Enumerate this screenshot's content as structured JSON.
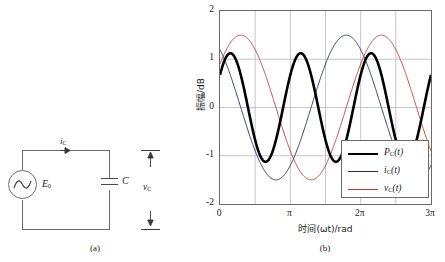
{
  "figure": {
    "panel_a_caption": "(a)",
    "panel_b_caption": "(b)"
  },
  "circuit": {
    "source_label": "E",
    "source_sub": "0",
    "source_icon": "ac-voltage-source-icon",
    "capacitor_label": "C",
    "capacitor_icon": "capacitor-icon",
    "current_label": "i",
    "current_sub": "C",
    "current_arrow_icon": "current-arrow-right-icon",
    "voltage_label": "v",
    "voltage_sub": "C",
    "voltage_arrow_icon": "voltage-arrow-icon"
  },
  "chart_data": {
    "type": "line",
    "title": "",
    "xlabel": "时间(ωt)/rad",
    "ylabel": "振幅/dB",
    "xlim": [
      0,
      9.4248
    ],
    "ylim": [
      -2,
      2
    ],
    "grid": true,
    "legend_position": "lower-right-inside",
    "xticks": [
      0,
      3.1416,
      6.2832,
      9.4248
    ],
    "xticklabels": [
      "0",
      "π",
      "2π",
      "3π"
    ],
    "yticks": [
      -2,
      -1,
      0,
      1,
      2
    ],
    "yticklabels": [
      "-2",
      "-1",
      "0",
      "1",
      "2"
    ],
    "series": [
      {
        "name": "P_C(t)",
        "legend_label_main": "P",
        "legend_label_sub": "C",
        "legend_label_tail": "(t)",
        "color": "#000000",
        "width": 2.6,
        "formula": "1.125*sin(2*x + 0.6435)",
        "amplitude": 1.125,
        "phase": 0.6435,
        "frequency": 2,
        "peak_value": 1.125,
        "trough_value": -1.125,
        "start_value": 0
      },
      {
        "name": "i_C(t)",
        "legend_label_main": "i",
        "legend_label_sub": "C",
        "legend_label_tail": "(t)",
        "color": "#1f2a5e",
        "width": 0.9,
        "formula": "1.5*cos(x + 0.6435)",
        "amplitude": 1.5,
        "phase": 0.6435,
        "frequency": 1,
        "peak_value": 1.5,
        "trough_value": -1.5,
        "start_value": 1.2
      },
      {
        "name": "v_C(t)",
        "legend_label_main": "v",
        "legend_label_sub": "C",
        "legend_label_tail": "(t)",
        "color": "#c0392b",
        "width": 0.9,
        "formula": "1.5*sin(x + 0.6435)",
        "amplitude": 1.5,
        "phase": 0.6435,
        "frequency": 1,
        "peak_value": 1.5,
        "trough_value": -1.5,
        "start_value": 0.9
      }
    ]
  }
}
